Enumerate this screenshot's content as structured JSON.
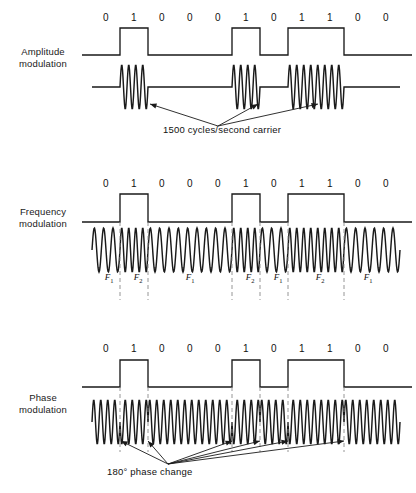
{
  "figure": {
    "bits": [
      "0",
      "1",
      "0",
      "0",
      "0",
      "1",
      "0",
      "1",
      "1",
      "0",
      "0"
    ],
    "geometry": {
      "left": 92,
      "right": 400,
      "cell_width": 28,
      "bit_label_start": 106
    },
    "stroke_color": "#1a1a1a",
    "dash_color": "#8a8a8a"
  },
  "sections": [
    {
      "id": "amplitude",
      "label_line1": "Amplitude",
      "label_line2": "modulation",
      "bit_label_y": 12,
      "square_baseline": 55,
      "square_top": 28,
      "carrier_axis": 87,
      "carrier_amplitude": 22,
      "carrier_cycles_per_bit": 4,
      "annotation": "1500 cycles/second carrier",
      "annotation_x": 163,
      "annotation_y": 130,
      "arrow_origin": [
        218,
        126
      ],
      "arrow_targets": [
        [
          150,
          104
        ],
        [
          258,
          104
        ],
        [
          318,
          104
        ]
      ]
    },
    {
      "id": "frequency",
      "label_line1": "Frequency",
      "label_line2": "modulation",
      "bit_label_y": 178,
      "square_baseline": 222,
      "square_top": 194,
      "carrier_axis": 250,
      "carrier_amplitude": 22,
      "f1_cycles_per_bit": 3,
      "f2_cycles_per_bit": 4,
      "freq_labels": [
        {
          "text": "F",
          "sub": "1",
          "x": 109,
          "y": 272
        },
        {
          "text": "F",
          "sub": "2",
          "x": 138,
          "y": 272
        },
        {
          "text": "F",
          "sub": "1",
          "x": 190,
          "y": 272
        },
        {
          "text": "F",
          "sub": "2",
          "x": 250,
          "y": 272
        },
        {
          "text": "F",
          "sub": "1",
          "x": 278,
          "y": 272
        },
        {
          "text": "F",
          "sub": "2",
          "x": 320,
          "y": 272
        },
        {
          "text": "F",
          "sub": "1",
          "x": 368,
          "y": 272
        }
      ],
      "dash_lines_x": [
        120,
        148,
        232,
        260,
        288,
        344
      ],
      "dash_top": 222,
      "dash_bottom": 300
    },
    {
      "id": "phase",
      "label_line1": "Phase",
      "label_line2": "modulation",
      "bit_label_y": 343,
      "square_baseline": 387,
      "square_top": 360,
      "carrier_axis": 422,
      "carrier_amplitude": 22,
      "carrier_cycles_per_bit": 4,
      "annotation": "180° phase change",
      "annotation_x": 107,
      "annotation_y": 472,
      "arrow_origin": [
        168,
        464
      ],
      "arrow_targets": [
        [
          121,
          441
        ],
        [
          148,
          441
        ],
        [
          232,
          441
        ],
        [
          260,
          441
        ],
        [
          288,
          441
        ],
        [
          344,
          441
        ]
      ],
      "dash_lines_x": [
        120,
        148,
        232,
        260,
        288,
        344
      ],
      "dash_top": 387,
      "dash_bottom": 452
    }
  ]
}
